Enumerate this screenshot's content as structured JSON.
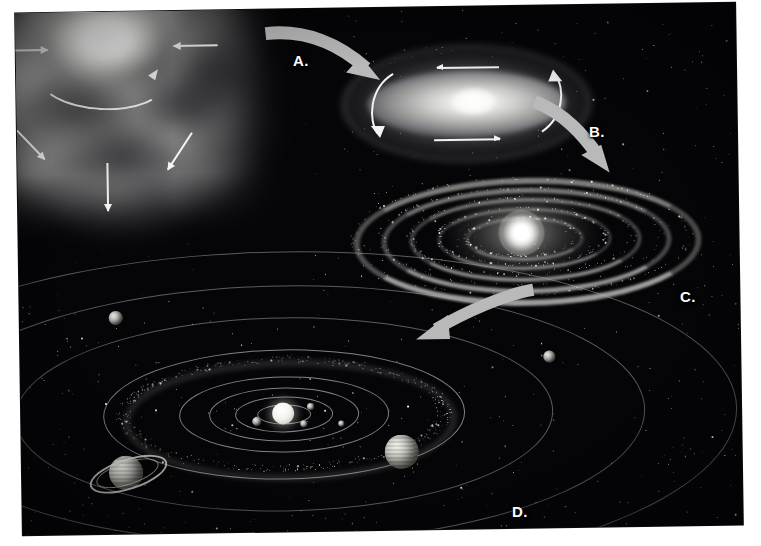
{
  "figure": {
    "medium": "grayscale scanned illustration",
    "background_color": "#050508",
    "plate_border_color": "#ffffff",
    "arrow_color": "#b9b9b9",
    "label_color": "#fbfbfb",
    "orbit_color": "#cdcdcd"
  },
  "labels": [
    {
      "id": "A",
      "text": "A.",
      "x": 293,
      "y": 52,
      "describes": "collapsing-rotating-nebula-to-disk"
    },
    {
      "id": "B",
      "text": "B.",
      "x": 589,
      "y": 123,
      "describes": "flattened-spinning-protoplanetary-disk"
    },
    {
      "id": "C",
      "text": "C.",
      "x": 680,
      "y": 288,
      "describes": "concentric-dust-rings-around-protostar"
    },
    {
      "id": "D",
      "text": "D.",
      "x": 512,
      "y": 503,
      "describes": "mature-solar-system-with-planets"
    }
  ],
  "stages": [
    {
      "key": "nebula",
      "letter": "A",
      "name": "Collapsing interstellar gas cloud",
      "caption": "Giant molecular cloud contracting under gravity",
      "contraction_arrow_count": 7,
      "rotation_arc": "counter-clockwise spin arc"
    },
    {
      "key": "flattening_disk",
      "letter": "B",
      "name": "Flattened rotating disk",
      "caption": "Cloud spins faster and flattens into a disk with a hot center",
      "rotation_arrow_count": 4
    },
    {
      "key": "dust_rings",
      "letter": "C",
      "name": "Rings of dust and debris",
      "caption": "Protostar ignites; material condenses into concentric rings",
      "ring_count": 5
    },
    {
      "key": "solar_system",
      "letter": "D",
      "name": "Mature solar system",
      "caption": "Rings accrete into planets orbiting the new star",
      "orbit_count": 8
    }
  ],
  "flow_arrows": [
    {
      "from": "A",
      "to": "B",
      "name": "arrow-nebula-to-disk"
    },
    {
      "from": "B",
      "to": "C",
      "name": "arrow-disk-to-rings"
    },
    {
      "from": "C",
      "to": "D",
      "name": "arrow-rings-to-solar-system"
    }
  ],
  "nebula_arrows": [
    {
      "x": 18,
      "y": 70,
      "len": 44,
      "angle": 0,
      "name": "infall-arrow-left"
    },
    {
      "x": 52,
      "y": 8,
      "len": 22,
      "angle": 62,
      "name": "infall-arrow-top-left"
    },
    {
      "x": 146,
      "y": 5,
      "len": 22,
      "angle": 108,
      "name": "infall-arrow-top-right"
    },
    {
      "x": 232,
      "y": 68,
      "len": 44,
      "angle": 180,
      "name": "infall-arrow-right"
    },
    {
      "x": 30,
      "y": 150,
      "len": 40,
      "angle": -47,
      "name": "infall-arrow-lower-left"
    },
    {
      "x": 120,
      "y": 184,
      "len": 48,
      "angle": -90,
      "name": "infall-arrow-bottom"
    },
    {
      "x": 205,
      "y": 155,
      "len": 44,
      "angle": -124,
      "name": "infall-arrow-lower-right"
    }
  ],
  "solar_system": {
    "star": {
      "name": "Sun",
      "cx": 262,
      "cy": 136,
      "r": 11
    },
    "asteroid_belt": {
      "name": "asteroid-belt",
      "cx": 262,
      "cy": 136,
      "rx": 160,
      "ry": 54
    },
    "orbits": [
      {
        "name": "orbit-1",
        "cx": 262,
        "cy": 136,
        "rx": 26,
        "ry": 9
      },
      {
        "name": "orbit-2",
        "cx": 262,
        "cy": 136,
        "rx": 48,
        "ry": 17
      },
      {
        "name": "orbit-3",
        "cx": 262,
        "cy": 136,
        "rx": 74,
        "ry": 26
      },
      {
        "name": "orbit-4",
        "cx": 262,
        "cy": 136,
        "rx": 104,
        "ry": 37
      },
      {
        "name": "orbit-5",
        "cx": 262,
        "cy": 136,
        "rx": 180,
        "ry": 64
      },
      {
        "name": "orbit-6",
        "cx": 262,
        "cy": 136,
        "rx": 268,
        "ry": 96
      },
      {
        "name": "orbit-7",
        "cx": 262,
        "cy": 136,
        "rx": 360,
        "ry": 128
      },
      {
        "name": "orbit-8",
        "cx": 262,
        "cy": 136,
        "rx": 452,
        "ry": 162
      }
    ],
    "planets": [
      {
        "name": "inner-planet-a",
        "type": "rocky",
        "cx": 235,
        "cy": 143,
        "r": 4.5
      },
      {
        "name": "inner-planet-b",
        "type": "rocky",
        "cx": 289,
        "cy": 129,
        "r": 3.5
      },
      {
        "name": "inner-planet-c",
        "type": "rocky",
        "cx": 282,
        "cy": 146,
        "r": 3.5
      },
      {
        "name": "inner-planet-d",
        "type": "rocky",
        "cx": 320,
        "cy": 147,
        "r": 3.0
      },
      {
        "name": "jupiter",
        "type": "gas-giant",
        "cx": 380,
        "cy": 176,
        "r": 17
      },
      {
        "name": "saturn",
        "type": "ringed-gas-giant",
        "cx": 104,
        "cy": 193,
        "r": 17
      },
      {
        "name": "outer-planet-1",
        "type": "ice-giant",
        "cx": 529,
        "cy": 83,
        "r": 6
      },
      {
        "name": "outer-planet-2",
        "type": "ice-giant",
        "cx": 96,
        "cy": 38,
        "r": 7
      }
    ]
  }
}
